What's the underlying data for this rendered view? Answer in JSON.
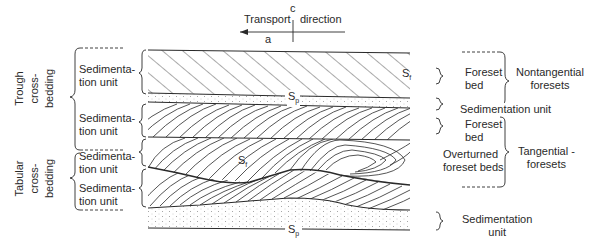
{
  "figure": {
    "transport": {
      "label_left": "Transport",
      "label_right": "direction",
      "axis_c": "c",
      "axis_a": "a"
    },
    "left_groups": {
      "trough": [
        "Trough",
        "cross-",
        "bedding"
      ],
      "tabular": [
        "Tabular",
        "cross-",
        "bedding"
      ]
    },
    "left_units": [
      {
        "line1": "Sedimenta-",
        "line2": "tion unit"
      },
      {
        "line1": "Sedimenta-",
        "line2": "tion unit"
      },
      {
        "line1": "Sedimenta-",
        "line2": "tion unit"
      },
      {
        "line1": "Sedimenta-",
        "line2": "tion unit"
      }
    ],
    "surface_labels": {
      "sf_upper": "S",
      "sf_upper_sub": "f",
      "sp_upper": "S",
      "sp_upper_sub": "p",
      "sf_lower": "S",
      "sf_lower_sub": "f",
      "sp_lower": "S",
      "sp_lower_sub": "p"
    },
    "right_labels": {
      "foreset_bed_1": [
        "Foreset",
        "bed"
      ],
      "nontangential": [
        "Nontangential",
        "foresets"
      ],
      "sedimentation_unit_mid": "Sedimentation unit",
      "foreset_bed_2": [
        "Foreset",
        "bed"
      ],
      "overturned": [
        "Overturned",
        "foreset beds"
      ],
      "tangential": [
        "Tangential -",
        "foresets"
      ],
      "sedimentation_unit_bottom": [
        "Sedimentation",
        "unit"
      ]
    },
    "colors": {
      "ink": "#2a2a2a",
      "dots": "#8a8a8a",
      "background": "#ffffff"
    }
  }
}
